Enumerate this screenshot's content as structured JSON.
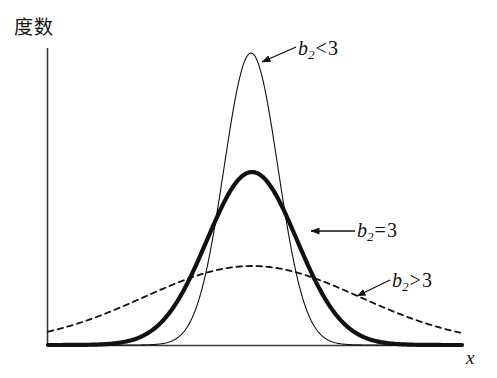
{
  "figure": {
    "y_axis_label": "度数",
    "x_axis_label": "x",
    "background_color": "#ffffff",
    "ink_color": "#111111"
  },
  "annotations": {
    "leptokurtic": {
      "symbol": "b",
      "subscript": "2",
      "relation": "<",
      "value": "3"
    },
    "mesokurtic": {
      "symbol": "b",
      "subscript": "2",
      "relation": "=",
      "value": "3"
    },
    "platykurtic": {
      "symbol": "b",
      "subscript": "2",
      "relation": ">",
      "value": "3"
    }
  },
  "chart_data": {
    "type": "line",
    "title": "",
    "xlabel": "x",
    "ylabel": "度数",
    "grid": false,
    "legend": "annotations-inline",
    "axis": {
      "origin_px": [
        47,
        345
      ],
      "y_top_px": 48,
      "x_right_px": 462,
      "xlim": [
        0,
        1
      ],
      "ylim": [
        0,
        1
      ]
    },
    "series": [
      {
        "name": "b2<3",
        "style": "thin-solid",
        "stroke_width": 1.1,
        "description": "tall narrow peaked curve (leptokurtic)",
        "mean_px_x": 251,
        "peak_px_y": 53,
        "sigma_px": 27,
        "peak_height_fraction": 1.0
      },
      {
        "name": "b2=3",
        "style": "thick-solid",
        "stroke_width": 4.2,
        "description": "medium bell-shaped normal curve (mesokurtic)",
        "mean_px_x": 252,
        "peak_px_y": 172,
        "sigma_px": 45,
        "peak_height_fraction": 0.59
      },
      {
        "name": "b2>3",
        "style": "dashed",
        "stroke_width": 1.8,
        "description": "low broad flat curve (platykurtic)",
        "mean_px_x": 252,
        "peak_px_y": 266,
        "sigma_px": 108,
        "peak_height_fraction": 0.27
      }
    ],
    "arrows": [
      {
        "target": "b2<3",
        "from_px": [
          296,
          47
        ],
        "to_px": [
          262,
          62
        ]
      },
      {
        "target": "b2=3",
        "from_px": [
          355,
          231
        ],
        "to_px": [
          311,
          231
        ]
      },
      {
        "target": "b2>3",
        "from_px": [
          390,
          280
        ],
        "to_px": [
          357,
          296
        ]
      }
    ]
  }
}
